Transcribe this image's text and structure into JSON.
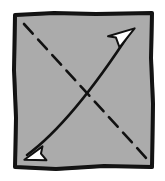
{
  "figure": {
    "type": "diagram",
    "canvas": {
      "width": 165,
      "height": 181,
      "background": "#ffffff"
    },
    "shapes": {
      "square": {
        "name": "gray-square",
        "label": "Square",
        "fill_color": "#ababab",
        "stroke_color": "#111111",
        "stroke_width": 4,
        "style": "hand-drawn",
        "path": "M 15,15 L 54,13 L 96,14 L 152,13 L 151,58 L 153,104 L 152,167 L 104,166 L 56,169 L 15,167 L 16,118 L 14,70 Z"
      },
      "dashed_diagonal": {
        "name": "dashed-diagonal",
        "label": "Dashed diagonal",
        "from": "top-left",
        "to": "bottom-right",
        "stroke_color": "#111111",
        "stroke_width": 2.6,
        "dash_pattern": "13 8",
        "arrowheads": "none",
        "path": "M 24,24 L 148,160"
      },
      "solid_arrow": {
        "name": "solid-double-arrow",
        "label": "Double-headed arrow",
        "from": "bottom-left",
        "to": "top-right",
        "stroke_color": "#111111",
        "stroke_width": 2.6,
        "dash_pattern": "none",
        "arrowheads": "both",
        "arrowhead_style": "hollow-triangle",
        "arrowhead_fill": "#ffffff",
        "curvature": "slight",
        "path": "M 27,155 Q 72,122 131,31"
      }
    }
  }
}
